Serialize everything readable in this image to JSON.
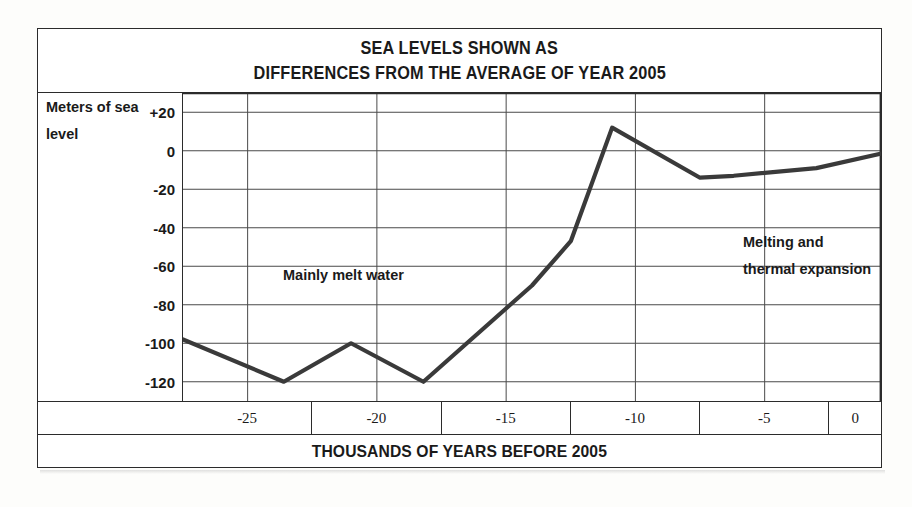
{
  "figure": {
    "title_lines": [
      "SEA LEVELS SHOWN AS",
      "DIFFERENCES FROM THE AVERAGE OF YEAR 2005"
    ],
    "y_axis_title_line1": "Meters of sea",
    "y_axis_title_line2": "level",
    "x_axis_title": "THOUSANDS OF YEARS BEFORE 2005",
    "annotations": [
      {
        "text": "Mainly melt water"
      },
      {
        "text": "Melting and"
      },
      {
        "text": "thermal expansion"
      }
    ]
  },
  "chart_data": {
    "type": "line",
    "title": "SEA LEVELS SHOWN AS DIFFERENCES FROM THE AVERAGE OF YEAR 2005",
    "xlabel": "THOUSANDS OF YEARS BEFORE 2005",
    "ylabel": "Meters of sea level",
    "xlim": [
      -27.5,
      -0.5
    ],
    "ylim": [
      -130,
      30
    ],
    "xticks": [
      -25,
      -20,
      -15,
      -10,
      -5,
      0
    ],
    "xtick_labels": [
      "-25",
      "-20",
      "-15",
      "-10",
      "-5",
      "0"
    ],
    "yticks": [
      20,
      0,
      -20,
      -40,
      -60,
      -80,
      -100,
      -120
    ],
    "ytick_labels": [
      "+20",
      "0",
      "-20",
      "-40",
      "-60",
      "-80",
      "-100",
      "-120"
    ],
    "grid": true,
    "legend": "none",
    "series": [
      {
        "name": "Sea level relative to year 2005",
        "style": "solid",
        "color": "#3a3a3a",
        "x": [
          -27.5,
          -23.6,
          -21.0,
          -18.2,
          -14.0,
          -12.5,
          -10.9,
          -7.5,
          -6.2,
          -3.0,
          0.0
        ],
        "y": [
          -98,
          -120,
          -100,
          -120,
          -70,
          -47,
          12,
          -14,
          -13,
          -9,
          0
        ]
      },
      {
        "name": "Projected sea level rise",
        "style": "dashed",
        "color": "#3a3a3a",
        "x": [
          0.0,
          2.5
        ],
        "y": [
          0,
          10
        ]
      }
    ],
    "markers": [
      {
        "name": "year-2005-marker",
        "x": 0,
        "y": 0,
        "shape": "circle-crosshair",
        "label": "Year 2005 reference point"
      }
    ],
    "annotations": [
      {
        "text": "Mainly melt water",
        "x": -18.0,
        "y": -44
      },
      {
        "text": "Melting and",
        "x": -3.4,
        "y": -20
      },
      {
        "text": "thermal expansion",
        "x": -3.4,
        "y": -33
      }
    ]
  }
}
